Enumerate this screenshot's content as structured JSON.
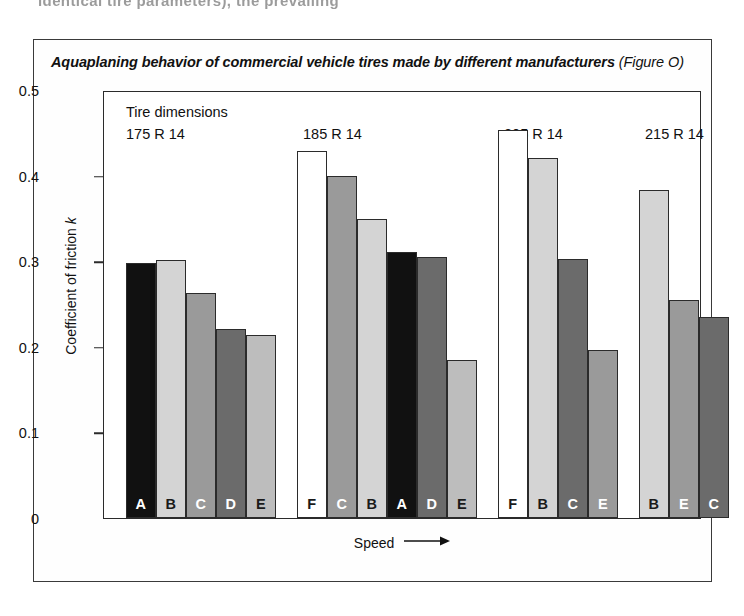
{
  "page": {
    "clipped_body_text": "identical tire parameters), the prevailing"
  },
  "figure": {
    "caption_main": "Aquaplaning behavior of commercial vehicle tires made by different manufacturers",
    "caption_number": "(Figure O)",
    "dimensions_caption": "Tire dimensions",
    "y_axis_title_pre": "Coefficient of friction ",
    "y_axis_title_symbol": "k",
    "x_axis_title": "Speed",
    "arrow_icon": "right-arrow-icon"
  },
  "chart_data": {
    "type": "bar",
    "title": "Aquaplaning behavior of commercial vehicle tires made by different manufacturers",
    "xlabel": "Speed",
    "ylabel": "Coefficient of friction k",
    "ylim": [
      0,
      0.5
    ],
    "ytick_labels": [
      "0",
      "0.1",
      "0.2",
      "0.3",
      "0.4",
      "0.5"
    ],
    "ytick_values": [
      0,
      0.1,
      0.2,
      0.3,
      0.4,
      0.5
    ],
    "grid": false,
    "legend": "none",
    "note": "Bars are labeled in-place with manufacturer letters A-F; fill shade encodes manufacturer.",
    "groups": [
      {
        "label": "175 R 14",
        "bars": [
          {
            "manufacturer": "A",
            "value": 0.3,
            "fill": "#111111",
            "letter_color": "#ffffff"
          },
          {
            "manufacturer": "B",
            "value": 0.303,
            "fill": "#d4d4d4",
            "letter_color": "#1a1a1a"
          },
          {
            "manufacturer": "C",
            "value": 0.265,
            "fill": "#9a9a9a",
            "letter_color": "#ffffff"
          },
          {
            "manufacturer": "D",
            "value": 0.222,
            "fill": "#6b6b6b",
            "letter_color": "#ffffff"
          },
          {
            "manufacturer": "E",
            "value": 0.215,
            "fill": "#bdbdbd",
            "letter_color": "#1a1a1a"
          }
        ]
      },
      {
        "label": "185 R 14",
        "bars": [
          {
            "manufacturer": "F",
            "value": 0.432,
            "fill": "#ffffff",
            "letter_color": "#1a1a1a"
          },
          {
            "manufacturer": "C",
            "value": 0.402,
            "fill": "#9a9a9a",
            "letter_color": "#ffffff"
          },
          {
            "manufacturer": "B",
            "value": 0.352,
            "fill": "#d4d4d4",
            "letter_color": "#1a1a1a"
          },
          {
            "manufacturer": "A",
            "value": 0.313,
            "fill": "#111111",
            "letter_color": "#ffffff"
          },
          {
            "manufacturer": "D",
            "value": 0.307,
            "fill": "#6b6b6b",
            "letter_color": "#ffffff"
          },
          {
            "manufacturer": "E",
            "value": 0.186,
            "fill": "#bdbdbd",
            "letter_color": "#1a1a1a"
          }
        ]
      },
      {
        "label": "205 R 14",
        "bars": [
          {
            "manufacturer": "F",
            "value": 0.456,
            "fill": "#ffffff",
            "letter_color": "#1a1a1a"
          },
          {
            "manufacturer": "B",
            "value": 0.423,
            "fill": "#d4d4d4",
            "letter_color": "#1a1a1a"
          },
          {
            "manufacturer": "C",
            "value": 0.305,
            "fill": "#6b6b6b",
            "letter_color": "#ffffff"
          },
          {
            "manufacturer": "E",
            "value": 0.198,
            "fill": "#9a9a9a",
            "letter_color": "#ffffff"
          }
        ]
      },
      {
        "label": "215 R 14",
        "bars": [
          {
            "manufacturer": "B",
            "value": 0.386,
            "fill": "#d4d4d4",
            "letter_color": "#1a1a1a"
          },
          {
            "manufacturer": "E",
            "value": 0.257,
            "fill": "#9a9a9a",
            "letter_color": "#ffffff"
          },
          {
            "manufacturer": "C",
            "value": 0.237,
            "fill": "#6b6b6b",
            "letter_color": "#ffffff"
          }
        ]
      }
    ]
  }
}
